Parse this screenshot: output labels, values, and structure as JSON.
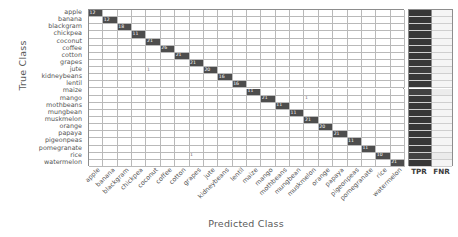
{
  "figure": {
    "xlabel": "Predicted Class",
    "ylabel": "True Class",
    "summary_headers": {
      "tpr": "TPR",
      "fnr": "FNR"
    }
  },
  "chart_data": {
    "type": "heatmap",
    "subtype": "confusion-matrix",
    "title": "",
    "xlabel": "Predicted Class",
    "ylabel": "True Class",
    "grid": true,
    "legend": "none",
    "colormap": {
      "diagonal_fill": "#4d4d4d",
      "offdiagonal_fill": "#ffffff",
      "grid_line": "#b9b9b9",
      "border": "#8d8d8d",
      "tpr_fill": "#595959",
      "fnr_fill": "#f2f2f2"
    },
    "categories": [
      "apple",
      "banana",
      "blackgram",
      "chickpea",
      "coconut",
      "coffee",
      "cotton",
      "grapes",
      "jute",
      "kidneybeans",
      "lentil",
      "maize",
      "mango",
      "mothbeans",
      "mungbean",
      "muskmelon",
      "orange",
      "papaya",
      "pigeonpeas",
      "pomegranate",
      "rice",
      "watermelon"
    ],
    "x_tick_labels": [
      "apple",
      "banana",
      "blackgram",
      "chickpea",
      "coconut",
      "coffee",
      "cotton",
      "grapes",
      "jute",
      "kidneybeans",
      "lentil",
      "maize",
      "mango",
      "mothbeans",
      "mungbean",
      "muskmelon",
      "orange",
      "papaya",
      "pigeonpeas",
      "pomegranate",
      "rice",
      "watermelon"
    ],
    "y_tick_labels": [
      "apple",
      "banana",
      "blackgram",
      "chickpea",
      "coconut",
      "coffee",
      "cotton",
      "grapes",
      "jute",
      "kidneybeans",
      "lentil",
      "maize",
      "mango",
      "mothbeans",
      "mungbean",
      "muskmelon",
      "orange",
      "papaya",
      "pigeonpeas",
      "pomegranate",
      "rice",
      "watermelon"
    ],
    "diagonal_values": [
      12,
      12,
      18,
      11,
      21,
      26,
      21,
      21,
      20,
      16,
      16,
      11,
      21,
      11,
      11,
      21,
      20,
      21,
      11,
      11,
      10,
      21
    ],
    "offdiagonal_cells": [
      {
        "true": "jute",
        "predicted": "coconut",
        "value": 1
      },
      {
        "true": "mango",
        "predicted": "muskmelon",
        "value": 1
      },
      {
        "true": "rice",
        "predicted": "grapes",
        "value": 1
      }
    ],
    "summary_columns": {
      "tpr": [
        100,
        100,
        100,
        100,
        100,
        100,
        100,
        100,
        95,
        100,
        100,
        92,
        100,
        100,
        100,
        100,
        100,
        100,
        100,
        100,
        91,
        100
      ],
      "fnr": [
        0,
        0,
        0,
        0,
        0,
        0,
        0,
        0,
        5,
        0,
        0,
        8,
        0,
        0,
        0,
        0,
        0,
        0,
        0,
        0,
        9,
        0
      ]
    }
  }
}
